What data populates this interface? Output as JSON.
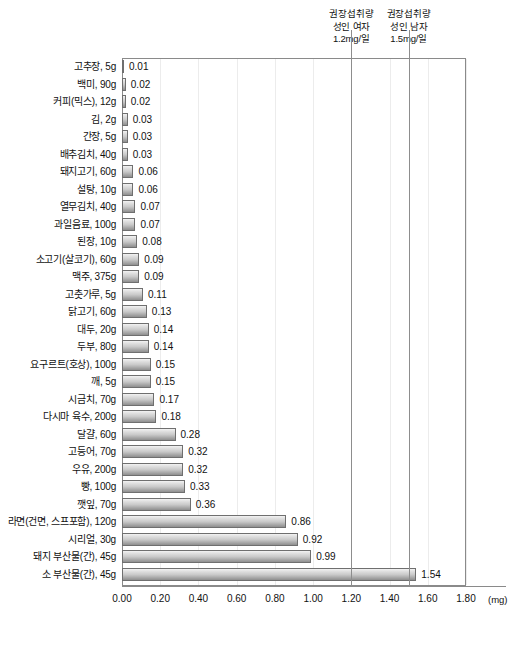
{
  "chart_data": {
    "type": "bar",
    "orientation": "horizontal",
    "title": "",
    "subtitle": "",
    "xlabel": "(mg)",
    "ylabel": "",
    "xlim": [
      0.0,
      1.8
    ],
    "xticks": [
      "0.00",
      "0.20",
      "0.40",
      "0.60",
      "0.80",
      "1.00",
      "1.20",
      "1.40",
      "1.60",
      "1.80"
    ],
    "xtick_values": [
      0.0,
      0.2,
      0.4,
      0.6,
      0.8,
      1.0,
      1.2,
      1.4,
      1.6,
      1.8
    ],
    "grid": true,
    "legend": "none",
    "unit": "(mg)",
    "categories": [
      "고추장, 5g",
      "백미, 90g",
      "커피(믹스), 12g",
      "김, 2g",
      "간장, 5g",
      "배추김치, 40g",
      "돼지고기, 60g",
      "설탕, 10g",
      "열무김치, 40g",
      "과일음료, 100g",
      "된장, 10g",
      "소고기(살코기), 60g",
      "맥주, 375g",
      "고춧가루, 5g",
      "닭고기, 60g",
      "대두, 20g",
      "두부, 80g",
      "요구르트(호상), 100g",
      "깨, 5g",
      "시금치, 70g",
      "다시마 육수, 200g",
      "달걀, 60g",
      "고등어, 70g",
      "우유, 200g",
      "빵, 100g",
      "깻잎, 70g",
      "라면(건면, 스프포함), 120g",
      "시리얼, 30g",
      "돼지 부산물(간), 45g",
      "소 부산물(간), 45g"
    ],
    "values": [
      0.01,
      0.02,
      0.02,
      0.03,
      0.03,
      0.03,
      0.06,
      0.06,
      0.07,
      0.07,
      0.08,
      0.09,
      0.09,
      0.11,
      0.13,
      0.14,
      0.14,
      0.15,
      0.15,
      0.17,
      0.18,
      0.28,
      0.32,
      0.32,
      0.33,
      0.36,
      0.86,
      0.92,
      0.99,
      1.54
    ],
    "value_labels": [
      "0.01",
      "0.02",
      "0.02",
      "0.03",
      "0.03",
      "0.03",
      "0.06",
      "0.06",
      "0.07",
      "0.07",
      "0.08",
      "0.09",
      "0.09",
      "0.11",
      "0.13",
      "0.14",
      "0.14",
      "0.15",
      "0.15",
      "0.17",
      "0.18",
      "0.28",
      "0.32",
      "0.32",
      "0.33",
      "0.36",
      "0.86",
      "0.92",
      "0.99",
      "1.54"
    ],
    "reference_lines": [
      {
        "value": 1.2,
        "label_lines": [
          "권장섭취량",
          "성인 여자",
          "1.2mg/일"
        ],
        "color": "#8d8d8d"
      },
      {
        "value": 1.5,
        "label_lines": [
          "권장섭취량",
          "성인 남자",
          "1.5mg/일"
        ],
        "color": "#8d8d8d"
      }
    ],
    "colors": {
      "bar_top": "#f3f3f3",
      "bar_bottom": "#8f8f8f",
      "bar_border": "#6f6f6f",
      "axis": "#8a8a8a",
      "gridline": "#ececec",
      "reference_line": "#8d8d8d",
      "text": "#111111",
      "background": "#ffffff"
    }
  }
}
